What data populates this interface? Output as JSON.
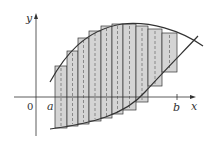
{
  "diagram": {
    "labels": {
      "y_axis": "y",
      "x_axis": "x",
      "origin": "0",
      "a": "a",
      "b": "b"
    },
    "colors": {
      "rect_fill": "#d4d4d4",
      "stroke": "#333333",
      "dash": "#555555"
    },
    "axes": {
      "x_axis_y": 97,
      "y_axis_x": 36
    },
    "rectangles": [
      {
        "x0": 55,
        "x1": 67,
        "top": 66,
        "bottom": 128
      },
      {
        "x0": 67,
        "x1": 78,
        "top": 51,
        "bottom": 126
      },
      {
        "x0": 78,
        "x1": 89,
        "top": 38,
        "bottom": 124
      },
      {
        "x0": 89,
        "x1": 101,
        "top": 31,
        "bottom": 121
      },
      {
        "x0": 101,
        "x1": 112,
        "top": 26,
        "bottom": 118
      },
      {
        "x0": 112,
        "x1": 123,
        "top": 24,
        "bottom": 114
      },
      {
        "x0": 123,
        "x1": 136,
        "top": 24,
        "bottom": 110
      },
      {
        "x0": 136,
        "x1": 148,
        "top": 26,
        "bottom": 102
      },
      {
        "x0": 148,
        "x1": 162,
        "top": 29,
        "bottom": 86
      },
      {
        "x0": 162,
        "x1": 177,
        "top": 33,
        "bottom": 72
      }
    ],
    "curves": {
      "top": "M50,82 C65,55 85,30 122,24 C150,21 180,30 203,46",
      "bottom": "M50,129 C90,124 125,115 145,92 C165,70 185,50 198,36"
    }
  }
}
